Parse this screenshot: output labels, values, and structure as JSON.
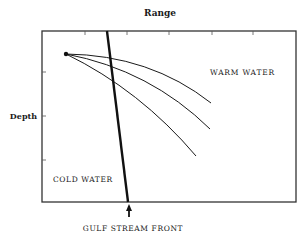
{
  "title": "Range",
  "axes": {
    "x_label": "Range",
    "y_label": "Depth",
    "x_ticks": [
      85,
      127,
      169,
      212,
      253
    ],
    "y_ticks": [
      72,
      116,
      160
    ]
  },
  "regions": {
    "warm": "WARM WATER",
    "cold": "COLD WATER"
  },
  "front": {
    "label": "GULF STREAM FRONT",
    "top": [
      107,
      31
    ],
    "bottom": [
      128,
      202
    ]
  },
  "source": {
    "x": 66,
    "y": 54
  },
  "rays": [
    {
      "name": "ray-1",
      "end": [
        211,
        103
      ]
    },
    {
      "name": "ray-2",
      "end": [
        210,
        129
      ]
    },
    {
      "name": "ray-3",
      "end": [
        196,
        156
      ]
    }
  ],
  "colors": {
    "line": "#1a1a1a",
    "frame": "#333333",
    "background": "#ffffff"
  }
}
